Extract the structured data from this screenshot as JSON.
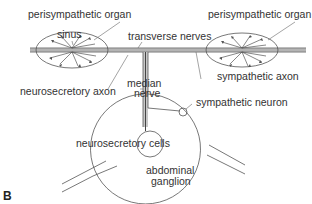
{
  "panel_label": "B",
  "labels": {
    "perisympathetic_organ_left": "perisympathetic organ",
    "perisympathetic_organ_right": "perisympathetic organ",
    "sinus": "sinus",
    "transverse_nerves": "transverse nerves",
    "neurosecretory_axon": "neurosecretory axon",
    "median_nerve_line1": "median",
    "median_nerve_line2": "nerve",
    "sympathetic_axon": "sympathetic axon",
    "sympathetic_neuron": "sympathetic neuron",
    "neurosecretory_cells": "neurosecretory cells",
    "abdominal_ganglion_line1": "abdominal",
    "abdominal_ganglion_line2": "ganglion"
  },
  "colors": {
    "line": "#555555",
    "text": "#333333",
    "nerve_fill": "#bdbdbd",
    "background": "#ffffff"
  }
}
